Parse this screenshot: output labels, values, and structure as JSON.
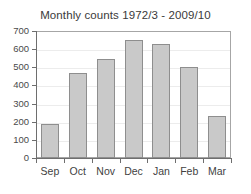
{
  "chart_data": {
    "type": "bar",
    "title": "Monthly counts 1972/3 - 2009/10",
    "xlabel": "",
    "ylabel": "",
    "categories": [
      "Sep",
      "Oct",
      "Nov",
      "Dec",
      "Jan",
      "Feb",
      "Mar"
    ],
    "values": [
      188,
      470,
      545,
      648,
      628,
      500,
      232
    ],
    "ylim": [
      0,
      700
    ],
    "ytick_labels": [
      "0",
      "100",
      "200",
      "300",
      "400",
      "500",
      "600",
      "700"
    ],
    "ytick_values": [
      0,
      100,
      200,
      300,
      400,
      500,
      600,
      700
    ],
    "grid": true,
    "legend": null,
    "bar_color": "#c9c9c9",
    "bar_edge_color": "#8e8e8e",
    "axis_color": "#6e6e6e",
    "grid_color": "#ececec",
    "background_color": "#ffffff"
  }
}
